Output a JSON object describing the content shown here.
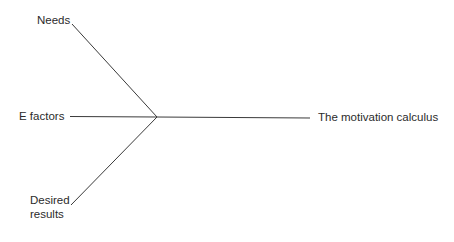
{
  "diagram": {
    "type": "convergence",
    "inputs": [
      {
        "id": "needs",
        "label": "Needs"
      },
      {
        "id": "e_factors",
        "label": "E factors"
      },
      {
        "id": "desired_results",
        "label": "Desired results",
        "lines": [
          "Desired",
          "results"
        ]
      }
    ],
    "output": {
      "id": "motivation_calculus",
      "label": "The motivation calculus"
    },
    "edges": [
      {
        "from": "needs",
        "to": "junction"
      },
      {
        "from": "e_factors",
        "to": "junction"
      },
      {
        "from": "desired_results",
        "to": "junction"
      },
      {
        "from": "junction",
        "to": "motivation_calculus"
      }
    ],
    "colors": {
      "line": "#3a3a3a",
      "text": "#2b2b2b",
      "background": "#ffffff"
    }
  }
}
